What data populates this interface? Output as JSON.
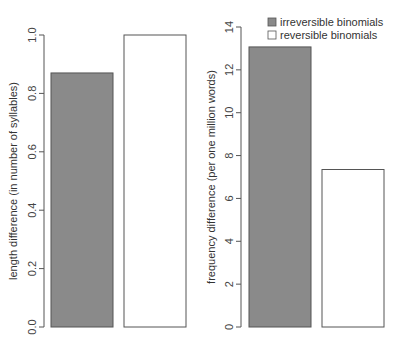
{
  "chart_data": [
    {
      "type": "bar",
      "title": "",
      "xlabel": "",
      "ylabel": "length difference (in number of syllables)",
      "ylim": [
        0,
        1.0
      ],
      "yticks": [
        "0.0",
        "0.2",
        "0.4",
        "0.6",
        "0.8",
        "1.0"
      ],
      "categories": [
        "irreversible binomials",
        "reversible binomials"
      ],
      "values": [
        0.87,
        1.0
      ],
      "colors": [
        "#8a8a8a",
        "#ffffff"
      ],
      "grid": false
    },
    {
      "type": "bar",
      "title": "",
      "xlabel": "",
      "ylabel": "frequency difference (per one million words)",
      "ylim": [
        0,
        14
      ],
      "yticks": [
        "0",
        "2",
        "4",
        "6",
        "8",
        "10",
        "12",
        "14"
      ],
      "categories": [
        "irreversible binomials",
        "reversible binomials"
      ],
      "values": [
        13.07,
        7.35
      ],
      "colors": [
        "#8a8a8a",
        "#ffffff"
      ],
      "grid": false,
      "legend": {
        "position": "top-right",
        "entries": [
          "irreversible binomials",
          "reversible binomials"
        ]
      }
    }
  ]
}
